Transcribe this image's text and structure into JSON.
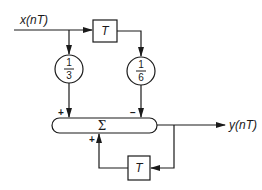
{
  "diagram": {
    "type": "signal-flow block diagram",
    "input": {
      "label": "x(nT)"
    },
    "output": {
      "label": "y(nT)"
    },
    "delay_forward": {
      "label": "T"
    },
    "delay_feedback": {
      "label": "T"
    },
    "multiplier_left": {
      "numerator": "1",
      "denominator": "3"
    },
    "multiplier_right": {
      "numerator": "1",
      "denominator": "6"
    },
    "summer": {
      "label": "Σ",
      "sign_left": "+",
      "sign_right": "−",
      "sign_feedback": "+"
    },
    "colors": {
      "stroke": "#1a1a1a",
      "background": "#ffffff"
    }
  }
}
